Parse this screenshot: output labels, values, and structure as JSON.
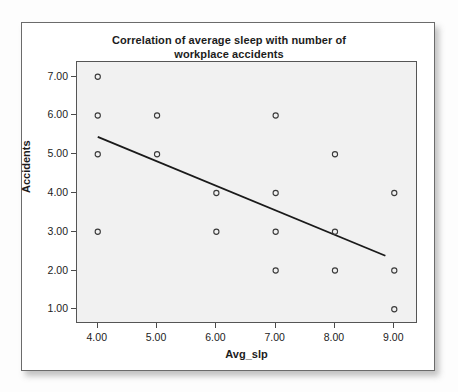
{
  "chart_data": {
    "type": "scatter",
    "title": "Correlation of average sleep with number of workplace accidents",
    "title_lines": [
      "Correlation of average sleep with number of",
      "workplace accidents"
    ],
    "xlabel": "Avg_slp",
    "ylabel": "Accidents",
    "xlim": [
      3.65,
      9.4
    ],
    "ylim": [
      0.62,
      7.38
    ],
    "xticks": [
      "4.00",
      "5.00",
      "6.00",
      "7.00",
      "8.00",
      "9.00"
    ],
    "xtick_values": [
      4,
      5,
      6,
      7,
      8,
      9
    ],
    "yticks": [
      "1.00",
      "2.00",
      "3.00",
      "4.00",
      "5.00",
      "6.00",
      "7.00"
    ],
    "ytick_values": [
      1,
      2,
      3,
      4,
      5,
      6,
      7
    ],
    "grid": false,
    "legend": "none",
    "marker": "open-circle",
    "points": [
      {
        "x": 4,
        "y": 7
      },
      {
        "x": 4,
        "y": 6
      },
      {
        "x": 4,
        "y": 5
      },
      {
        "x": 4,
        "y": 3
      },
      {
        "x": 5,
        "y": 6
      },
      {
        "x": 5,
        "y": 5
      },
      {
        "x": 6,
        "y": 4
      },
      {
        "x": 6,
        "y": 3
      },
      {
        "x": 7,
        "y": 6
      },
      {
        "x": 7,
        "y": 4
      },
      {
        "x": 7,
        "y": 3
      },
      {
        "x": 7,
        "y": 2
      },
      {
        "x": 8,
        "y": 5
      },
      {
        "x": 8,
        "y": 3
      },
      {
        "x": 8,
        "y": 2
      },
      {
        "x": 9,
        "y": 4
      },
      {
        "x": 9,
        "y": 2
      },
      {
        "x": 9,
        "y": 1
      }
    ],
    "fit_line": {
      "name": "linear-regression-fit",
      "x_start": 4.0,
      "y_start": 5.45,
      "x_end": 8.85,
      "y_end": 2.38,
      "slope": -0.633,
      "intercept": 7.98
    }
  },
  "colors": {
    "plot_background": "#f1f1f1",
    "page_background": "#ffffff",
    "axis_line": "#555555",
    "marker_stroke": "#3a3a3a",
    "fit_line": "#1a1a1a",
    "text": "#1c1c1c",
    "card_border": "#6b6b6b"
  }
}
